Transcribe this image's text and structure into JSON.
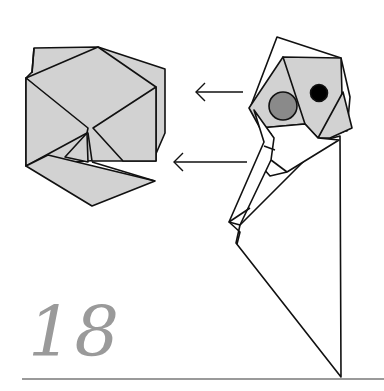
{
  "step": {
    "number": "18"
  },
  "colors": {
    "paper_fill": "#d2d2d2",
    "paper_white": "#ffffff",
    "stroke": "#111111",
    "eye_gray": "#8a8a8a",
    "eye_black": "#000000",
    "step_number": "#9a9a9a",
    "rule": "#9a9a9a"
  },
  "figures": [
    {
      "name": "result-model",
      "description": "finished folded cube-like model (gray)"
    },
    {
      "name": "in-progress-model",
      "description": "figure with head and two eyes, body flaps white"
    }
  ],
  "arrows": [
    {
      "name": "arrow-top",
      "direction": "left"
    },
    {
      "name": "arrow-bottom",
      "direction": "left"
    }
  ]
}
